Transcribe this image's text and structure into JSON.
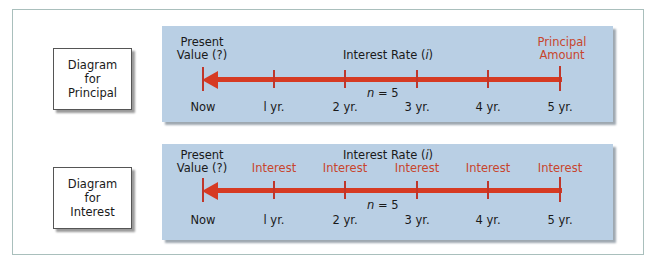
{
  "colors": {
    "panel_bg": "#b9cfe4",
    "arrow": "#d63a22",
    "accent_text": "#c8452d",
    "frame_border": "#a9bfbc"
  },
  "diagrams": [
    {
      "label": [
        "Diagram",
        "for",
        "Principal"
      ],
      "start_label": [
        "Present",
        "Value (?)"
      ],
      "rate_label": "Interest Rate (",
      "rate_symbol": "i",
      "rate_close": ")",
      "end_label": [
        "Principal",
        "Amount"
      ],
      "n_symbol": "n",
      "n_value": "= 5",
      "periods": [
        "Now",
        "l yr.",
        "2 yr.",
        "3 yr.",
        "4 yr.",
        "5 yr."
      ]
    },
    {
      "label": [
        "Diagram",
        "for",
        "Interest"
      ],
      "start_label": [
        "Present",
        "Value (?)"
      ],
      "rate_label": "Interest Rate (",
      "rate_symbol": "i",
      "rate_close": ")",
      "flow_labels": [
        "Interest",
        "Interest",
        "Interest",
        "Interest",
        "Interest"
      ],
      "n_symbol": "n",
      "n_value": "= 5",
      "periods": [
        "Now",
        "l yr.",
        "2 yr.",
        "3 yr.",
        "4 yr.",
        "5 yr."
      ]
    }
  ]
}
